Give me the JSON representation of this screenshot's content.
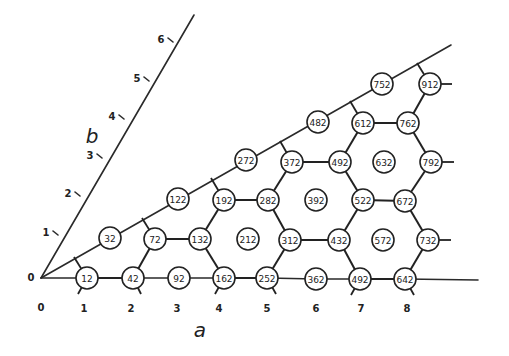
{
  "diagram": {
    "axes": {
      "a": {
        "name": "a",
        "label_pos": [
          200,
          330
        ],
        "start": [
          41,
          278
        ],
        "end": [
          478,
          280
        ],
        "ticks": [
          {
            "label": "0",
            "x": 41,
            "y": 307
          },
          {
            "label": "1",
            "x": 84,
            "y": 308
          },
          {
            "label": "2",
            "x": 131,
            "y": 308
          },
          {
            "label": "3",
            "x": 177,
            "y": 308
          },
          {
            "label": "4",
            "x": 219,
            "y": 308
          },
          {
            "label": "5",
            "x": 267,
            "y": 308
          },
          {
            "label": "6",
            "x": 316,
            "y": 308
          },
          {
            "label": "7",
            "x": 361,
            "y": 308
          },
          {
            "label": "8",
            "x": 407,
            "y": 308
          }
        ]
      },
      "b": {
        "name": "b",
        "label_pos": [
          92,
          136
        ],
        "start": [
          41,
          278
        ],
        "end": [
          194,
          15
        ],
        "ticks": [
          {
            "label": "1",
            "x": 54,
            "y": 234,
            "tx": 63,
            "ty": 237
          },
          {
            "label": "2",
            "x": 76,
            "y": 195,
            "tx": 85,
            "ty": 198
          },
          {
            "label": "3",
            "x": 98,
            "y": 157,
            "tx": 107,
            "ty": 160
          },
          {
            "label": "4",
            "x": 120,
            "y": 118,
            "tx": 130,
            "ty": 121
          },
          {
            "label": "5",
            "x": 145,
            "y": 80,
            "tx": 153,
            "ty": 82
          },
          {
            "label": "6",
            "x": 169,
            "y": 41,
            "tx": 176,
            "ty": 43
          }
        ]
      },
      "origin_label": {
        "label": "0",
        "x": 31,
        "y": 277
      }
    },
    "diagonal": {
      "start": [
        41,
        278
      ],
      "end": [
        451,
        45
      ]
    },
    "nodes": [
      {
        "id": "12",
        "label": "12",
        "x": 87,
        "y": 278
      },
      {
        "id": "42",
        "label": "42",
        "x": 133,
        "y": 278
      },
      {
        "id": "92",
        "label": "92",
        "x": 179,
        "y": 278
      },
      {
        "id": "162",
        "label": "162",
        "x": 224,
        "y": 278
      },
      {
        "id": "252",
        "label": "252",
        "x": 267,
        "y": 278
      },
      {
        "id": "362",
        "label": "362",
        "x": 316,
        "y": 279
      },
      {
        "id": "492b",
        "label": "492",
        "x": 360,
        "y": 279
      },
      {
        "id": "642",
        "label": "642",
        "x": 405,
        "y": 279
      },
      {
        "id": "32",
        "label": "32",
        "x": 110,
        "y": 238
      },
      {
        "id": "72",
        "label": "72",
        "x": 155,
        "y": 239
      },
      {
        "id": "132",
        "label": "132",
        "x": 200,
        "y": 239
      },
      {
        "id": "212",
        "label": "212",
        "x": 248,
        "y": 239
      },
      {
        "id": "312",
        "label": "312",
        "x": 290,
        "y": 240
      },
      {
        "id": "432",
        "label": "432",
        "x": 339,
        "y": 240
      },
      {
        "id": "572",
        "label": "572",
        "x": 383,
        "y": 240
      },
      {
        "id": "732",
        "label": "732",
        "x": 428,
        "y": 240
      },
      {
        "id": "122",
        "label": "122",
        "x": 178,
        "y": 199
      },
      {
        "id": "192",
        "label": "192",
        "x": 224,
        "y": 200
      },
      {
        "id": "282",
        "label": "282",
        "x": 268,
        "y": 200
      },
      {
        "id": "392",
        "label": "392",
        "x": 316,
        "y": 200
      },
      {
        "id": "522",
        "label": "522",
        "x": 363,
        "y": 200
      },
      {
        "id": "672",
        "label": "672",
        "x": 405,
        "y": 201
      },
      {
        "id": "272",
        "label": "272",
        "x": 246,
        "y": 160
      },
      {
        "id": "372",
        "label": "372",
        "x": 292,
        "y": 162
      },
      {
        "id": "492a",
        "label": "492",
        "x": 340,
        "y": 162
      },
      {
        "id": "632",
        "label": "632",
        "x": 384,
        "y": 162
      },
      {
        "id": "792",
        "label": "792",
        "x": 431,
        "y": 162
      },
      {
        "id": "482",
        "label": "482",
        "x": 318,
        "y": 122
      },
      {
        "id": "612",
        "label": "612",
        "x": 363,
        "y": 123
      },
      {
        "id": "762",
        "label": "762",
        "x": 408,
        "y": 123
      },
      {
        "id": "752",
        "label": "752",
        "x": 382,
        "y": 84
      },
      {
        "id": "912",
        "label": "912",
        "x": 430,
        "y": 84
      }
    ],
    "bonds": [
      [
        "12",
        "42"
      ],
      [
        "42",
        "72"
      ],
      [
        "72",
        "132"
      ],
      [
        "132",
        "162"
      ],
      [
        "132",
        "192"
      ],
      [
        "162",
        "252"
      ],
      [
        "192",
        "282"
      ],
      [
        "282",
        "312"
      ],
      [
        "312",
        "252"
      ],
      [
        "282",
        "372"
      ],
      [
        "312",
        "432"
      ],
      [
        "432",
        "492b"
      ],
      [
        "492b",
        "642"
      ],
      [
        "372",
        "492a"
      ],
      [
        "492a",
        "522"
      ],
      [
        "522",
        "432"
      ],
      [
        "522",
        "672"
      ],
      [
        "672",
        "732"
      ],
      [
        "732",
        "642"
      ],
      [
        "492a",
        "612"
      ],
      [
        "612",
        "762"
      ],
      [
        "762",
        "792"
      ],
      [
        "792",
        "672"
      ],
      [
        "762",
        "912"
      ]
    ],
    "thin_links": [
      [
        "origin",
        "12"
      ],
      [
        "42",
        "92"
      ],
      [
        "92",
        "162"
      ],
      [
        "252",
        "362"
      ],
      [
        "362",
        "492b"
      ],
      [
        "642",
        "a_end"
      ]
    ],
    "stubs": [
      {
        "x1": 87,
        "y1": 278,
        "x2": 74,
        "y2": 257
      },
      {
        "x1": 87,
        "y1": 278,
        "x2": 78,
        "y2": 294
      },
      {
        "x1": 133,
        "y1": 278,
        "x2": 141,
        "y2": 294
      },
      {
        "x1": 224,
        "y1": 278,
        "x2": 215,
        "y2": 294
      },
      {
        "x1": 267,
        "y1": 278,
        "x2": 276,
        "y2": 294
      },
      {
        "x1": 360,
        "y1": 279,
        "x2": 351,
        "y2": 295
      },
      {
        "x1": 405,
        "y1": 279,
        "x2": 414,
        "y2": 295
      },
      {
        "x1": 155,
        "y1": 239,
        "x2": 142,
        "y2": 218
      },
      {
        "x1": 224,
        "y1": 200,
        "x2": 211,
        "y2": 178
      },
      {
        "x1": 292,
        "y1": 162,
        "x2": 280,
        "y2": 141
      },
      {
        "x1": 363,
        "y1": 123,
        "x2": 350,
        "y2": 101
      },
      {
        "x1": 430,
        "y1": 84,
        "x2": 417,
        "y2": 63
      },
      {
        "x1": 430,
        "y1": 84,
        "x2": 452,
        "y2": 84
      },
      {
        "x1": 431,
        "y1": 162,
        "x2": 454,
        "y2": 162
      },
      {
        "x1": 428,
        "y1": 240,
        "x2": 451,
        "y2": 240
      }
    ],
    "node_radius": 11
  }
}
